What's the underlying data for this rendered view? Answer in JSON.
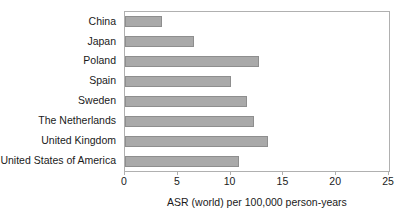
{
  "chart_data": {
    "type": "bar",
    "orientation": "horizontal",
    "title": "",
    "xlabel": "ASR (world) per 100,000 person-years",
    "ylabel": "",
    "categories": [
      "China",
      "Japan",
      "Poland",
      "Spain",
      "Sweden",
      "The Netherlands",
      "United Kingdom",
      "United States of America"
    ],
    "values": [
      3.5,
      6.5,
      12.7,
      10.0,
      11.6,
      12.2,
      13.5,
      10.8
    ],
    "xlim": [
      0,
      25
    ],
    "xticks": [
      0,
      5,
      10,
      15,
      20,
      25
    ],
    "xtick_labels": [
      "0",
      "5",
      "10",
      "15",
      "20",
      "25"
    ],
    "grid": false,
    "legend": false,
    "legend_position": "none",
    "bar_color": "#a9a9a9",
    "bar_edge_color": "#8e8e8e",
    "frame_color": "#b0b0b0",
    "background_color": "#ffffff",
    "text_color": "#1a1a1a"
  }
}
